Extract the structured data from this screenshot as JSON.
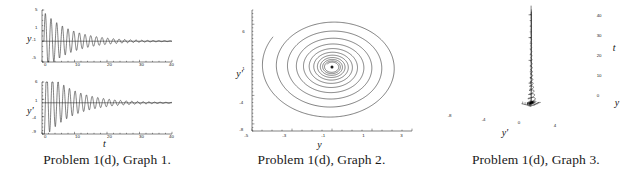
{
  "figure": {
    "panels": [
      {
        "name": "graph-1",
        "caption": "Problem 1(d), Graph 1.",
        "subplots": [
          {
            "name": "y-vs-t",
            "ylabel": "y",
            "xlabel": "",
            "yticks": [
              "5",
              "1",
              "-1",
              "-5"
            ],
            "ytick_values": [
              5,
              1,
              -1,
              -5
            ],
            "xticks": [
              "0",
              "10",
              "20",
              "30",
              "40"
            ],
            "xtick_values": [
              0,
              10,
              20,
              30,
              40
            ]
          },
          {
            "name": "yprime-vs-t",
            "ylabel": "y'",
            "xlabel": "t",
            "yticks": [
              "6",
              "1",
              "-4",
              "-9"
            ],
            "ytick_values": [
              6,
              1,
              -4,
              -9
            ],
            "xticks": [
              "0",
              "10",
              "20",
              "30",
              "40"
            ],
            "xtick_values": [
              0,
              10,
              20,
              30,
              40
            ]
          }
        ]
      },
      {
        "name": "graph-2",
        "caption": "Problem 1(d), Graph 2.",
        "subplots": [
          {
            "name": "phase-portrait",
            "ylabel": "y'",
            "xlabel": "y",
            "yticks": [
              "6",
              "1",
              "-4",
              "-8"
            ],
            "ytick_values": [
              6,
              1,
              -4,
              -8
            ],
            "xticks": [
              "-5",
              "-3",
              "-1",
              "1",
              "3"
            ],
            "xtick_values": [
              -5,
              -3,
              -1,
              1,
              3
            ]
          }
        ]
      },
      {
        "name": "graph-3",
        "caption": "Problem 1(d), Graph 3.",
        "subplots": [
          {
            "name": "surface-3d",
            "zlabel": "t",
            "ylabel": "y",
            "xlabel": "y'",
            "zticks": [
              "40",
              "30",
              "20",
              "10",
              "0"
            ],
            "ztick_values": [
              40,
              30,
              20,
              10,
              0
            ],
            "xticks": [
              "-8",
              "-4",
              "0",
              "4"
            ],
            "xtick_values": [
              -8,
              -4,
              0,
              4
            ]
          }
        ]
      }
    ]
  },
  "chart_data": [
    {
      "type": "line",
      "name": "graph-1-top",
      "title": "Problem 1(d), Graph 1.",
      "xlabel": "t",
      "ylabel": "y",
      "xlim": [
        0,
        40
      ],
      "ylim": [
        -5,
        5
      ],
      "xticks": [
        0,
        10,
        20,
        30,
        40
      ],
      "yticks": [
        -5,
        -1,
        1,
        5
      ],
      "grid": false,
      "legend": "none",
      "description": "Damped oscillation of y about the equilibrium y = -1; amplitude decays from about 5 near t = 1 to nearly zero by t = 40.",
      "series": [
        {
          "name": "y(t)",
          "model": "y = -1 + A*exp(-k*t)*sin(w*t)",
          "amplitude0": 6.0,
          "decay": 0.115,
          "angular_frequency": 3.6,
          "offset": -1.0,
          "phase": 0.0
        },
        {
          "name": "equilibrium",
          "model": "y = -1",
          "value": -1.0
        }
      ]
    },
    {
      "type": "line",
      "name": "graph-1-bottom",
      "title": "Problem 1(d), Graph 1.",
      "xlabel": "t",
      "ylabel": "y'",
      "xlim": [
        0,
        40
      ],
      "ylim": [
        -9,
        6
      ],
      "xticks": [
        0,
        10,
        20,
        30,
        40
      ],
      "yticks": [
        -9,
        -4,
        1,
        6
      ],
      "grid": false,
      "legend": "none",
      "description": "Damped oscillation of the derivative y' about 0; amplitude decays from about 9 near t = 1 to nearly zero by t = 40.",
      "series": [
        {
          "name": "y'(t)",
          "model": "y' = A*exp(-k*t)*cos(w*t)",
          "amplitude0": 11.0,
          "decay": 0.115,
          "angular_frequency": 3.6,
          "offset": 0.0,
          "phase": 0.0
        },
        {
          "name": "equilibrium",
          "model": "y' = 0",
          "value": 0.0
        }
      ]
    },
    {
      "type": "line",
      "name": "graph-2-phase",
      "title": "Problem 1(d), Graph 2.",
      "xlabel": "y",
      "ylabel": "y'",
      "xlim": [
        -5,
        3
      ],
      "ylim": [
        -9,
        8
      ],
      "xticks": [
        -5,
        -3,
        -1,
        1,
        3
      ],
      "yticks": [
        -8,
        -4,
        1,
        6
      ],
      "grid": false,
      "legend": "none",
      "description": "Phase-plane trajectory spiraling inward clockwise to the stable focus at (y, y') = (-1, 0).",
      "series": [
        {
          "name": "trajectory",
          "spiral_center": [
            -1,
            0
          ],
          "start_point": [
            -4.4,
            1.5
          ],
          "end_point": [
            -1,
            0
          ],
          "turns": 11,
          "decay": 0.115
        }
      ]
    },
    {
      "type": "line",
      "name": "graph-3-3d",
      "title": "Problem 1(d), Graph 3.",
      "xlabel": "y'",
      "ylabel": "y",
      "zlabel": "t",
      "zlim": [
        0,
        40
      ],
      "zticks": [
        0,
        10,
        20,
        30,
        40
      ],
      "xticks": [
        -8,
        -4,
        0,
        4
      ],
      "grid": false,
      "legend": "none",
      "description": "Three-dimensional phase-time curve (y, y', t) forming a decaying helix that narrows to a vertical line as t increases to 40.",
      "series": [
        {
          "name": "helix",
          "turns": 23,
          "decay": 0.115,
          "t_range": [
            0,
            40
          ]
        }
      ]
    }
  ]
}
